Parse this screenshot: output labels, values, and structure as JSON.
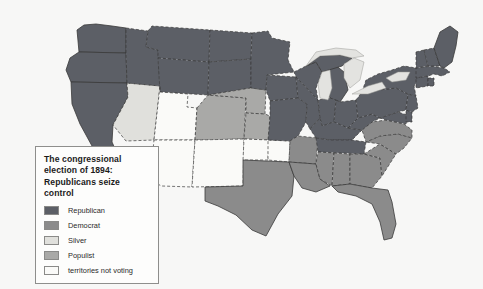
{
  "map": {
    "title": "The congressional election of 1894: Republicans seize control",
    "background_color": "#f7f7f6",
    "ocean_color": "#f7f7f6",
    "border_color": "#3a3a3a",
    "lake_color": "#e3e3e0"
  },
  "legend": {
    "title": "The congressional election of 1894: Republicans seize control",
    "box_background": "#fdfdfc",
    "box_border": "#8e8e8c",
    "items": [
      {
        "label": "Republican",
        "color": "#5c5f66"
      },
      {
        "label": "Democrat",
        "color": "#8b8b8b"
      },
      {
        "label": "Silver",
        "color": "#e0e0dc"
      },
      {
        "label": "Populist",
        "color": "#a9a9a7"
      },
      {
        "label": "territories not voting",
        "color": "#fafaf8"
      }
    ]
  },
  "regions": [
    {
      "name": "Washington",
      "party": "Republican"
    },
    {
      "name": "Oregon",
      "party": "Republican"
    },
    {
      "name": "California",
      "party": "Republican"
    },
    {
      "name": "Nevada",
      "party": "Silver"
    },
    {
      "name": "Idaho",
      "party": "Republican"
    },
    {
      "name": "Montana",
      "party": "Republican"
    },
    {
      "name": "Wyoming",
      "party": "Republican"
    },
    {
      "name": "Utah",
      "party": "territories not voting"
    },
    {
      "name": "Colorado",
      "party": "Populist"
    },
    {
      "name": "Arizona",
      "party": "territories not voting"
    },
    {
      "name": "New Mexico",
      "party": "territories not voting"
    },
    {
      "name": "North Dakota",
      "party": "Republican"
    },
    {
      "name": "South Dakota",
      "party": "Republican"
    },
    {
      "name": "Nebraska",
      "party": "Populist"
    },
    {
      "name": "Kansas",
      "party": "Populist"
    },
    {
      "name": "Oklahoma",
      "party": "territories not voting"
    },
    {
      "name": "Indian Territory",
      "party": "territories not voting"
    },
    {
      "name": "Texas",
      "party": "Democrat"
    },
    {
      "name": "Minnesota",
      "party": "Republican"
    },
    {
      "name": "Iowa",
      "party": "Republican"
    },
    {
      "name": "Missouri",
      "party": "Republican"
    },
    {
      "name": "Arkansas",
      "party": "Democrat"
    },
    {
      "name": "Louisiana",
      "party": "Democrat"
    },
    {
      "name": "Wisconsin",
      "party": "Republican"
    },
    {
      "name": "Illinois",
      "party": "Republican"
    },
    {
      "name": "Michigan",
      "party": "Republican"
    },
    {
      "name": "Indiana",
      "party": "Republican"
    },
    {
      "name": "Ohio",
      "party": "Republican"
    },
    {
      "name": "Kentucky",
      "party": "Republican"
    },
    {
      "name": "Tennessee",
      "party": "Republican"
    },
    {
      "name": "Mississippi",
      "party": "Democrat"
    },
    {
      "name": "Alabama",
      "party": "Democrat"
    },
    {
      "name": "Georgia",
      "party": "Democrat"
    },
    {
      "name": "Florida",
      "party": "Democrat"
    },
    {
      "name": "South Carolina",
      "party": "Democrat"
    },
    {
      "name": "North Carolina",
      "party": "Democrat"
    },
    {
      "name": "Virginia",
      "party": "Democrat"
    },
    {
      "name": "West Virginia",
      "party": "Republican"
    },
    {
      "name": "Maryland",
      "party": "Republican"
    },
    {
      "name": "Delaware",
      "party": "Republican"
    },
    {
      "name": "Pennsylvania",
      "party": "Republican"
    },
    {
      "name": "New Jersey",
      "party": "Republican"
    },
    {
      "name": "New York",
      "party": "Republican"
    },
    {
      "name": "Connecticut",
      "party": "Republican"
    },
    {
      "name": "Rhode Island",
      "party": "Republican"
    },
    {
      "name": "Massachusetts",
      "party": "Republican"
    },
    {
      "name": "Vermont",
      "party": "Republican"
    },
    {
      "name": "New Hampshire",
      "party": "Republican"
    },
    {
      "name": "Maine",
      "party": "Republican"
    }
  ]
}
